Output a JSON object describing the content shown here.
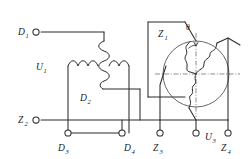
{
  "diagram": {
    "terminals": [
      {
        "id": "D1",
        "label": "D",
        "sub": "1",
        "x": 36,
        "y": 32,
        "label_x": 18,
        "label_y": 35
      },
      {
        "id": "Z2",
        "label": "Z",
        "sub": "2",
        "x": 36,
        "y": 120,
        "label_x": 18,
        "label_y": 123
      },
      {
        "id": "D3",
        "label": "D",
        "sub": "3",
        "x": 68,
        "y": 133,
        "label_x": 58,
        "label_y": 151
      },
      {
        "id": "D4",
        "label": "D",
        "sub": "4",
        "x": 122,
        "y": 133,
        "label_x": 113,
        "label_y": 151
      },
      {
        "id": "Z3",
        "label": "Z",
        "sub": "3",
        "x": 160,
        "y": 133,
        "label_x": 151,
        "label_y": 151
      },
      {
        "id": "Z4",
        "label": "Z",
        "sub": "4",
        "x": 228,
        "y": 133,
        "label_x": 219,
        "label_y": 151
      }
    ],
    "winding_labels": [
      {
        "id": "U1",
        "label": "U",
        "sub": "1",
        "x": 36,
        "y": 70
      },
      {
        "id": "D2",
        "label": "D",
        "sub": "2",
        "x": 80,
        "y": 101
      },
      {
        "id": "Z1",
        "label": "Z",
        "sub": "1",
        "x": 158,
        "y": 33
      },
      {
        "id": "U3",
        "label": "U",
        "sub": "3",
        "x": 189,
        "y": 140
      }
    ],
    "angle_label": {
      "id": "theta",
      "symbol": "θ",
      "x": 192,
      "y": 28
    },
    "phasor_circle": {
      "cx": 196,
      "cy": 74,
      "r": 33
    },
    "colors": {
      "wire": "#2b2b2b",
      "axis": "#6a6a6a",
      "circle": "#4a4a4a",
      "background": "#ffffff",
      "text": "#1a1a1a"
    }
  }
}
